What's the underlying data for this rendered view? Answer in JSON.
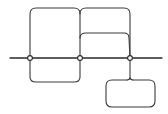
{
  "diagram": {
    "type": "line-loop-diagram",
    "stroke_color": "#3a3a3a",
    "background": "#ffffff",
    "main_line": {
      "x1": 10,
      "x2": 162,
      "y": 58
    },
    "nodes": [
      {
        "id": "node-left",
        "x": 30,
        "y": 58
      },
      {
        "id": "node-middle",
        "x": 80,
        "y": 58
      },
      {
        "id": "node-right",
        "x": 130,
        "y": 58
      }
    ],
    "loops": [
      {
        "id": "top-left-loop",
        "from": "node-left",
        "to": "node-middle",
        "direction": "up",
        "extent_y": 8
      },
      {
        "id": "top-right-outer-loop",
        "from": "node-middle",
        "to": "node-right",
        "direction": "up",
        "extent_y": 8
      },
      {
        "id": "top-right-inner-loop",
        "from": "node-middle",
        "to": "node-right",
        "direction": "up",
        "extent_y": 33
      },
      {
        "id": "bottom-left-loop",
        "from": "node-left",
        "to": "node-middle",
        "direction": "down",
        "extent_y": 82
      }
    ],
    "pendant_box": {
      "id": "bottom-right-box",
      "attached_to": "node-right",
      "x": 106,
      "y": 80,
      "width": 49,
      "height": 27
    }
  }
}
